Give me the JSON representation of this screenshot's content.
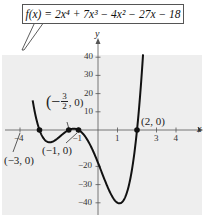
{
  "chart_data": {
    "type": "line",
    "equation_display": "f(x) = 2x⁴ + 7x³ − 4x² − 27x − 18",
    "xlabel": "x",
    "ylabel": "y",
    "xlim": [
      -4.5,
      4.5
    ],
    "ylim": [
      -45,
      50
    ],
    "x_ticks": [
      -4,
      -1,
      1,
      3,
      4
    ],
    "x_tick_labels": [
      "−4",
      "−1",
      "1",
      "3",
      "4"
    ],
    "y_ticks": [
      -40,
      -30,
      -20,
      10,
      20,
      30,
      40
    ],
    "y_tick_labels": [
      "−40",
      "−30",
      "−20",
      "10",
      "20",
      "30",
      "40"
    ],
    "grid": false,
    "background": "#eeeeee",
    "curve_color": "#111111",
    "zeros": [
      {
        "x": -3,
        "y": 0,
        "label": "(−3, 0)"
      },
      {
        "x": -1.5,
        "y": 0,
        "label": "(−3/2, 0)"
      },
      {
        "x": -1,
        "y": 0,
        "label": "(−1, 0)"
      },
      {
        "x": 2,
        "y": 0,
        "label": "(2, 0)"
      }
    ],
    "series": [
      {
        "name": "f(x)",
        "x": [
          -3.3,
          -3.2,
          -3.1,
          -3.0,
          -2.8,
          -2.6,
          -2.4,
          -2.2,
          -2.0,
          -1.8,
          -1.6,
          -1.5,
          -1.3,
          -1.2,
          -1.0,
          -0.8,
          -0.6,
          -0.4,
          -0.2,
          0.0,
          0.2,
          0.4,
          0.6,
          0.8,
          1.0,
          1.1,
          1.2,
          1.4,
          1.6,
          1.8,
          2.0,
          2.1,
          2.2,
          2.3
        ],
        "values": [
          21.8,
          13.5,
          6.2,
          0.0,
          -8.7,
          -12.9,
          -13.9,
          -12.5,
          -8.0,
          -4.3,
          -1.2,
          0.0,
          0.9,
          0.7,
          0.0,
          -2.8,
          -6.8,
          -11.4,
          -15.6,
          -18.0,
          -23.1,
          -28.2,
          -33.0,
          -36.8,
          -40.0,
          -40.3,
          -39.5,
          -36.1,
          -27.8,
          -15.8,
          0.0,
          9.8,
          21.0,
          33.8
        ]
      }
    ]
  },
  "labels": {
    "x_axis": "x",
    "y_axis": "y",
    "zero_labels": [
      "(−3, 0)",
      "(−1, 0)",
      "(2, 0)"
    ],
    "frac_num": "3",
    "frac_den": "2",
    "frac_prefix": "(−",
    "frac_suffix": ", 0)"
  }
}
